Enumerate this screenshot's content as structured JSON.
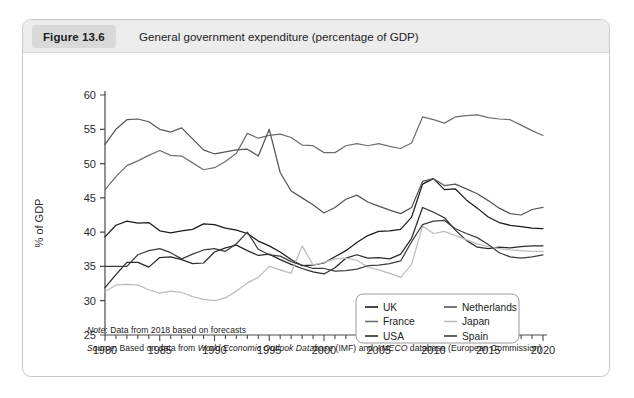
{
  "figure": {
    "badge": "Figure 13.6",
    "title": "General government expenditure (percentage of GDP)",
    "note_label": "Note",
    "note_text": ": Data from 2018 based on forecasts",
    "source_label": "Source",
    "source_prefix": ": Based on data from ",
    "source_italic_1": "World Economic Outlook Database",
    "source_mid": " (IMF) and ",
    "source_italic_2": "AMECO",
    "source_suffix": " database (European Commission)"
  },
  "colors": {
    "uk": "#1b1b1b",
    "france": "#6e6e6e",
    "usa": "#2a2a2a",
    "netherlands": "#555555",
    "japan": "#bcbcbc",
    "spain": "#3d3d3d",
    "axis": "#4a4a4a",
    "frame": "#c9c9c9",
    "header_bg": "#ececed",
    "badge_bg": "#d9d9da"
  },
  "chart_data": {
    "type": "line",
    "title": "General government expenditure (percentage of GDP)",
    "xlabel": "",
    "ylabel": "% of GDP",
    "xlim": [
      1980,
      2020
    ],
    "ylim": [
      25,
      60
    ],
    "yticks": [
      25,
      30,
      35,
      40,
      45,
      50,
      55,
      60
    ],
    "xticks": [
      1980,
      1985,
      1990,
      1995,
      2000,
      2005,
      2010,
      2015,
      2020
    ],
    "xtick_labels": [
      "1980",
      "1985",
      "1990",
      "1995",
      "2000",
      "2005",
      "2010",
      "2015",
      "2020"
    ],
    "ytick_labels": [
      "25",
      "30",
      "35",
      "40",
      "45",
      "50",
      "55",
      "60"
    ],
    "minor_xtick_step": 1,
    "grid": false,
    "legend_position": "inside-bottom-right",
    "legend_columns": 2,
    "x": [
      1980,
      1981,
      1982,
      1983,
      1984,
      1985,
      1986,
      1987,
      1988,
      1989,
      1990,
      1991,
      1992,
      1993,
      1994,
      1995,
      1996,
      1997,
      1998,
      1999,
      2000,
      2001,
      2002,
      2003,
      2004,
      2005,
      2006,
      2007,
      2008,
      2009,
      2010,
      2011,
      2012,
      2013,
      2014,
      2015,
      2016,
      2017,
      2018,
      2019,
      2020
    ],
    "series": [
      {
        "name": "UK",
        "color": "#1b1b1b",
        "values": [
          39.3,
          41.0,
          41.6,
          41.3,
          41.4,
          40.2,
          39.9,
          40.2,
          40.4,
          41.2,
          41.1,
          40.6,
          40.3,
          39.8,
          38.7,
          38.0,
          37.1,
          36.0,
          35.1,
          35.2,
          35.5,
          36.4,
          37.3,
          38.5,
          39.5,
          40.1,
          40.2,
          40.4,
          42.2,
          47.0,
          47.8,
          46.2,
          46.3,
          44.7,
          43.5,
          42.2,
          41.4,
          41.0,
          40.8,
          40.6,
          40.5
        ],
        "endpoint": 40.5
      },
      {
        "name": "France",
        "color": "#6e6e6e",
        "values": [
          46.2,
          48.1,
          49.7,
          50.4,
          51.2,
          51.9,
          51.2,
          51.1,
          50.1,
          49.1,
          49.4,
          50.3,
          51.5,
          54.4,
          53.7,
          54.1,
          54.3,
          53.8,
          52.7,
          52.6,
          51.6,
          51.6,
          52.6,
          52.9,
          52.6,
          52.9,
          52.5,
          52.2,
          53.0,
          56.8,
          56.4,
          55.9,
          56.8,
          57.0,
          57.1,
          56.7,
          56.5,
          56.4,
          55.6,
          54.8,
          54.1
        ],
        "endpoint": 54.1
      },
      {
        "name": "USA",
        "color": "#2a2a2a",
        "values": [
          31.9,
          33.8,
          35.6,
          35.6,
          34.9,
          36.3,
          36.4,
          36.0,
          35.4,
          35.5,
          37.1,
          37.7,
          38.1,
          37.3,
          36.6,
          36.8,
          36.0,
          35.3,
          34.7,
          34.2,
          33.9,
          34.8,
          36.2,
          36.7,
          36.2,
          36.3,
          36.1,
          36.8,
          39.1,
          43.6,
          42.9,
          42.1,
          40.3,
          38.8,
          37.8,
          37.6,
          37.8,
          37.7,
          37.9,
          38.0,
          38.0
        ],
        "endpoint": 38.0
      },
      {
        "name": "Netherlands",
        "color": "#555555",
        "values": [
          52.8,
          55.0,
          56.4,
          56.5,
          56.1,
          55.0,
          54.6,
          55.2,
          53.6,
          52.0,
          51.4,
          51.7,
          52.0,
          52.1,
          51.1,
          55.0,
          48.7,
          46.0,
          45.0,
          44.0,
          42.8,
          43.6,
          44.8,
          45.4,
          44.4,
          43.8,
          43.2,
          42.7,
          43.6,
          47.4,
          47.8,
          46.8,
          47.0,
          46.3,
          45.6,
          44.6,
          43.5,
          42.7,
          42.5,
          43.3,
          43.6
        ],
        "endpoint": 43.6
      },
      {
        "name": "Japan",
        "color": "#bcbcbc",
        "values": [
          31.3,
          32.3,
          32.4,
          32.3,
          31.6,
          31.1,
          31.4,
          31.2,
          30.6,
          30.2,
          30.0,
          30.4,
          31.4,
          32.6,
          33.4,
          35.0,
          34.5,
          34.0,
          38.0,
          35.2,
          35.6,
          36.1,
          36.2,
          35.9,
          34.9,
          34.5,
          34.0,
          33.4,
          35.3,
          40.9,
          39.8,
          40.1,
          39.5,
          38.9,
          38.3,
          37.9,
          37.6,
          37.4,
          37.3,
          37.2,
          37.2
        ],
        "endpoint": 37.2
      },
      {
        "name": "Spain",
        "color": "#3d3d3d",
        "values": [
          35.0,
          35.0,
          35.0,
          36.7,
          37.3,
          37.6,
          37.0,
          36.1,
          36.8,
          37.4,
          37.6,
          37.2,
          38.3,
          40.0,
          37.5,
          36.7,
          36.5,
          35.7,
          35.2,
          34.7,
          34.7,
          34.3,
          34.4,
          34.6,
          35.1,
          35.2,
          35.4,
          35.8,
          38.6,
          41.1,
          41.6,
          41.7,
          40.5,
          39.8,
          39.2,
          38.2,
          37.0,
          36.4,
          36.2,
          36.4,
          36.7
        ],
        "endpoint": 36.7
      }
    ],
    "legend": [
      {
        "label": "UK",
        "color": "#1b1b1b"
      },
      {
        "label": "Netherlands",
        "color": "#555555"
      },
      {
        "label": "France",
        "color": "#6e6e6e"
      },
      {
        "label": "Japan",
        "color": "#bcbcbc"
      },
      {
        "label": "USA",
        "color": "#2a2a2a"
      },
      {
        "label": "Spain",
        "color": "#3d3d3d"
      }
    ]
  }
}
